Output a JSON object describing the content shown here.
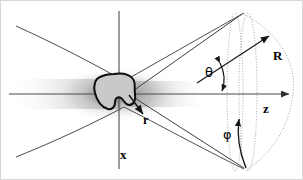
{
  "figure": {
    "kind": "scientific-schematic",
    "background_color": "#ffffff",
    "line_color": "#3a3a3a",
    "axis_color": "#4a4a4a",
    "blob_fill": "#c9c9c9",
    "blob_stroke": "#111111",
    "dotted_color": "#9a9a9a",
    "labels": {
      "axis_x": "x",
      "axis_z": "z",
      "vector_R": "R",
      "vector_r": "r",
      "angle_theta": "θ",
      "angle_phi": "φ"
    },
    "elements": {
      "beam_waist": "hyperbolic beam envelope",
      "particle": "irregular scattering blob",
      "cone": "scattering cone from origin",
      "sphere": "dotted spherical detection surface",
      "meridian_ellipses": 2
    },
    "geometry": {
      "origin": {
        "x": 128,
        "y": 93
      },
      "x_axis": {
        "x": 118,
        "y_top": 10,
        "y_bottom": 168
      },
      "z_axis": {
        "y": 93,
        "x_start": 8,
        "x_end": 291
      },
      "cone_half_angle_deg": 18,
      "sphere_radius_px": 163
    }
  }
}
